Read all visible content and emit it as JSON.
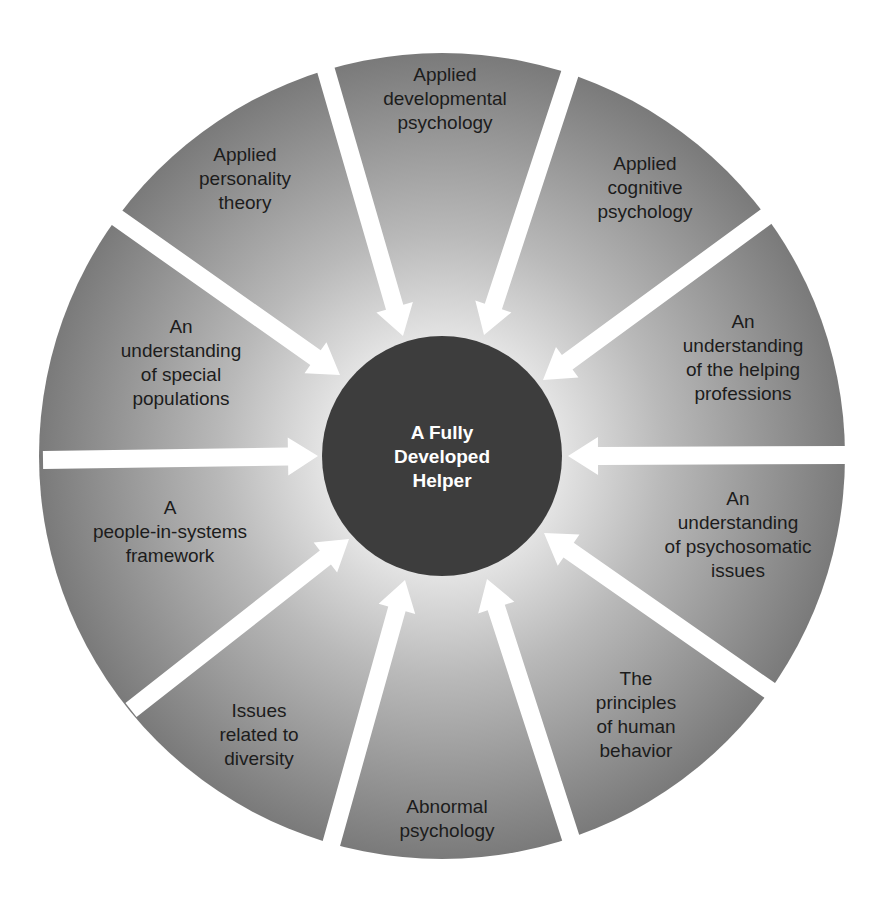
{
  "diagram": {
    "title": "A Fully Developed Helper",
    "center": {
      "lines": [
        "A Fully",
        "Developed",
        "Helper"
      ],
      "fill": "#3d3d3d",
      "text_color": "#ffffff"
    },
    "outer_circle": {
      "cx": 442,
      "cy": 456,
      "r": 403,
      "fill_inner": "#e6e6e6",
      "fill_outer": "#7a7a7a"
    },
    "inner_circle": {
      "cx": 442,
      "cy": 456,
      "r": 120
    },
    "arrow_color": "#ffffff",
    "arrows": [
      {
        "x1": 323,
        "y1": 60,
        "x2": 403,
        "y2": 336
      },
      {
        "x1": 573,
        "y1": 64,
        "x2": 484,
        "y2": 335
      },
      {
        "x1": 771,
        "y1": 213,
        "x2": 543,
        "y2": 380
      },
      {
        "x1": 846,
        "y1": 455,
        "x2": 568,
        "y2": 456
      },
      {
        "x1": 772,
        "y1": 692,
        "x2": 544,
        "y2": 533
      },
      {
        "x1": 574,
        "y1": 848,
        "x2": 487,
        "y2": 579
      },
      {
        "x1": 329,
        "y1": 852,
        "x2": 405,
        "y2": 580
      },
      {
        "x1": 131,
        "y1": 710,
        "x2": 349,
        "y2": 539
      },
      {
        "x1": 43,
        "y1": 460,
        "x2": 318,
        "y2": 456
      },
      {
        "x1": 116,
        "y1": 217,
        "x2": 340,
        "y2": 375
      }
    ],
    "segments": [
      {
        "id": "applied-developmental-psychology",
        "lines": [
          "Applied",
          "developmental",
          "psychology"
        ],
        "x": 445,
        "y": 99
      },
      {
        "id": "applied-cognitive-psychology",
        "lines": [
          "Applied",
          "cognitive",
          "psychology"
        ],
        "x": 645,
        "y": 188
      },
      {
        "id": "understanding-helping-professions",
        "lines": [
          "An",
          "understanding",
          "of the helping",
          "professions"
        ],
        "x": 743,
        "y": 358
      },
      {
        "id": "understanding-psychosomatic-issues",
        "lines": [
          "An",
          "understanding",
          "of psychosomatic",
          "issues"
        ],
        "x": 738,
        "y": 535
      },
      {
        "id": "principles-human-behavior",
        "lines": [
          "The",
          "principles",
          "of human",
          "behavior"
        ],
        "x": 636,
        "y": 715
      },
      {
        "id": "abnormal-psychology",
        "lines": [
          "Abnormal",
          "psychology"
        ],
        "x": 447,
        "y": 819
      },
      {
        "id": "issues-related-to-diversity",
        "lines": [
          "Issues",
          "related to",
          "diversity"
        ],
        "x": 259,
        "y": 735
      },
      {
        "id": "people-in-systems-framework",
        "lines": [
          "A",
          "people-in-systems",
          "framework"
        ],
        "x": 170,
        "y": 532
      },
      {
        "id": "understanding-special-populations",
        "lines": [
          "An",
          "understanding",
          "of special",
          "populations"
        ],
        "x": 181,
        "y": 363
      },
      {
        "id": "applied-personality-theory",
        "lines": [
          "Applied",
          "personality",
          "theory"
        ],
        "x": 245,
        "y": 179
      }
    ]
  }
}
